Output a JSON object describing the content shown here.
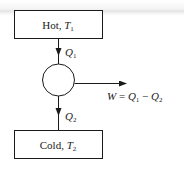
{
  "diagram": {
    "type": "heat-engine",
    "hot_reservoir": {
      "label": "Hot, ",
      "var": "T",
      "sub": "1"
    },
    "cold_reservoir": {
      "label": "Cold, ",
      "var": "T",
      "sub": "2"
    },
    "heat_in": {
      "var": "Q",
      "sub": "1"
    },
    "heat_out": {
      "var": "Q",
      "sub": "2"
    },
    "work": {
      "lhs": "W",
      "eq": " = ",
      "t1": "Q",
      "t1_sub": "1",
      "minus": " − ",
      "t2": "Q",
      "t2_sub": "2"
    },
    "colors": {
      "stroke": "#1a1a1a",
      "background": "#ffffff"
    }
  }
}
